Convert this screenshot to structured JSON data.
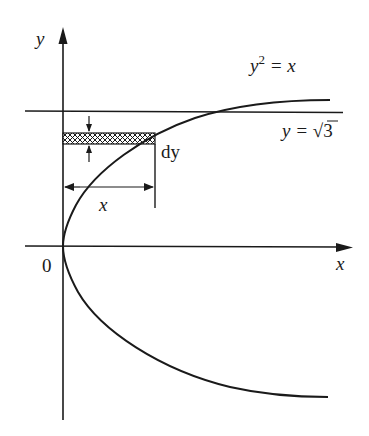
{
  "figure": {
    "type": "area-by-horizontal-strips",
    "axes": {
      "x_label": "x",
      "y_label": "y",
      "origin_label": "0"
    },
    "curve": {
      "equation_label_lhs": "y",
      "equation_label_exp": "2",
      "equation_label_rhs": " = x"
    },
    "line": {
      "label_lhs": "y = ",
      "label_root": "√",
      "label_radicand": "3"
    },
    "strip": {
      "thickness_label": "dy",
      "width_label": "x",
      "fill_pattern": "crosshatch"
    },
    "colors": {
      "stroke": "#1a1a1a",
      "background": "#ffffff"
    }
  }
}
